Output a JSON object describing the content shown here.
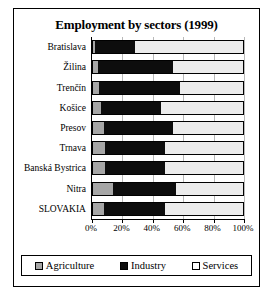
{
  "chart_data": {
    "type": "bar",
    "orientation": "horizontal",
    "stacked": true,
    "stack_mode": "percent",
    "title": "Employment by sectors (1999)",
    "xlabel": "",
    "ylabel": "",
    "xlim": [
      0,
      100
    ],
    "grid": true,
    "legend_position": "bottom",
    "xticklabels": [
      "0%",
      "20%",
      "40%",
      "60%",
      "80%",
      "100%"
    ],
    "xticks": [
      0,
      20,
      40,
      60,
      80,
      100
    ],
    "categories": [
      "Bratislava",
      "Žilina",
      "Trenčín",
      "Košice",
      "Presov",
      "Trnava",
      "Banská Bystrica",
      "Nitra",
      "SLOVAKIA"
    ],
    "series": [
      {
        "name": "Agriculture",
        "color": "#a6a6a6",
        "values": [
          1,
          3,
          4,
          5,
          7,
          8,
          8,
          13,
          7
        ]
      },
      {
        "name": "Industry",
        "color": "#0d0d0d",
        "values": [
          27,
          50,
          54,
          40,
          46,
          40,
          40,
          42,
          41
        ]
      },
      {
        "name": "Services",
        "color": "#ececec",
        "values": [
          72,
          47,
          42,
          55,
          47,
          52,
          52,
          45,
          52
        ]
      }
    ]
  },
  "legend": {
    "entries": [
      {
        "label": "Agriculture",
        "color": "#a6a6a6"
      },
      {
        "label": "Industry",
        "color": "#0d0d0d"
      },
      {
        "label": "Services",
        "color": "#ffffff"
      }
    ]
  }
}
